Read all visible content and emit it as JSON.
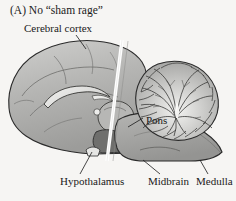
{
  "figure": {
    "panel_letter": "(A)",
    "panel_title": "No “sham rage”",
    "panel_heading": "(A)  No “sham rage”",
    "type": "anatomical-illustration",
    "background_color": "#f6f5f3",
    "ink_color": "#1a1a1a",
    "labels": {
      "cerebral_cortex": "Cerebral cortex",
      "pons": "Pons",
      "hypothalamus": "Hypothalamus",
      "midbrain": "Midbrain",
      "medulla": "Medulla"
    },
    "structures": [
      {
        "name": "cerebral-cortex",
        "fill": "#b9b9b7"
      },
      {
        "name": "cerebellum",
        "fill": "#a9a9a7"
      },
      {
        "name": "brainstem",
        "fill": "#a3a3a1"
      },
      {
        "name": "corpus-callosum",
        "fill": "#e8e8e6"
      },
      {
        "name": "thalamus",
        "fill": "#bdbdbb"
      },
      {
        "name": "hypothalamus",
        "fill": "#9a9a98"
      },
      {
        "name": "transection-line",
        "fill": "#ffffff"
      }
    ]
  }
}
